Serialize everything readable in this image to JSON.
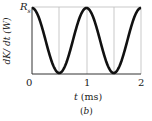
{
  "chart_data": {
    "type": "line",
    "title": "",
    "xlabel": "t (ms)",
    "ylabel": "dK/ dt (W)",
    "xlim": [
      0,
      2
    ],
    "ylim": [
      0,
      "R_s"
    ],
    "x_ticks": [
      "0",
      "1",
      "2"
    ],
    "y_ticks": [
      "R_s"
    ],
    "grid": true,
    "series": [
      {
        "name": "dK/dt",
        "function": "R_s * cos^2(pi * t)",
        "x": [
          0,
          0.25,
          0.5,
          0.75,
          1.0,
          1.25,
          1.5,
          1.75,
          2.0
        ],
        "values": [
          1,
          0.5,
          0,
          0.5,
          1,
          0.5,
          0,
          0.5,
          1
        ]
      }
    ],
    "caption": "(b)"
  },
  "labels": {
    "ymax": "R",
    "ymax_sub": "s",
    "ylabel": "dK/ dt (W)",
    "xlabel": "t (ms)",
    "x0": "0",
    "x1": "1",
    "x2": "2",
    "caption": "(b)"
  }
}
